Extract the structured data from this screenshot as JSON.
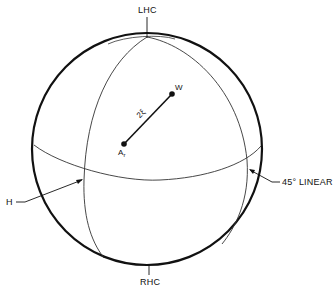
{
  "diagram": {
    "type": "poincare-sphere",
    "labels": {
      "top_pole": "LHC",
      "bottom_pole": "RHC",
      "left_point": "H",
      "right_point": "45° LINEAR",
      "point_w": "W",
      "point_a": "A",
      "point_a_sub": "r",
      "arc_label": "2ξ"
    },
    "colors": {
      "outline": "#111111",
      "lines": "#333333",
      "background": "#ffffff"
    }
  }
}
